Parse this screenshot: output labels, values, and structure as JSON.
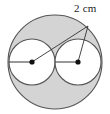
{
  "figure": {
    "type": "geometry-diagram",
    "background_color": "#ffffff",
    "shaded_region_color": "#d4d4d4",
    "inner_circle_fill": "#ffffff",
    "stroke_color": "#555555",
    "dot_color": "#111111",
    "leader_line_color": "#333333",
    "outer_circle": {
      "label": "outer-circle",
      "center_x": 55,
      "center_y": 62,
      "radius": 47
    },
    "inner_circles": [
      {
        "label": "left-inner-circle",
        "center_x": 32,
        "center_y": 62,
        "radius": 23
      },
      {
        "label": "right-inner-circle",
        "center_x": 78,
        "center_y": 62,
        "radius": 23
      }
    ],
    "center_dots": [
      {
        "label": "left-center-dot",
        "x": 32,
        "y": 62,
        "r": 2.6
      },
      {
        "label": "right-center-dot",
        "x": 78,
        "y": 62,
        "r": 2.6
      }
    ],
    "radius_segments": [
      {
        "label": "left-radius-segment",
        "x1": 9,
        "y1": 62,
        "x2": 32,
        "y2": 62
      },
      {
        "label": "right-radius-segment",
        "x1": 55,
        "y1": 62,
        "x2": 78,
        "y2": 62
      }
    ],
    "leader_lines": [
      {
        "label": "leader-line-to-left-center",
        "x1": 88,
        "y1": 26,
        "x2": 32,
        "y2": 62
      },
      {
        "label": "leader-line-to-right-center",
        "x1": 88,
        "y1": 26,
        "x2": 78,
        "y2": 62
      }
    ],
    "label": {
      "text": "2 cm",
      "value": 2,
      "unit": "cm",
      "x": 74,
      "y": 2
    }
  }
}
